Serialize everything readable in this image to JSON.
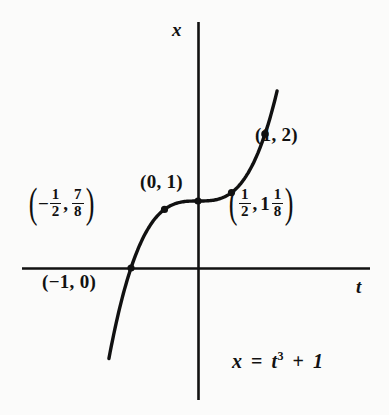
{
  "figure": {
    "caption_equation": "x = t³ + 1",
    "background_color": "#fbfbfa",
    "ink_color": "#111111"
  },
  "axes": {
    "x_axis_label": "x",
    "t_axis_label": "t",
    "origin_px": [
      198,
      268
    ],
    "pixels_per_unit": 67,
    "horizontal_extent_px": [
      22,
      370
    ],
    "vertical_extent_px": [
      22,
      400
    ]
  },
  "equation": {
    "lhs": "x",
    "equals": "=",
    "variable": "t",
    "exponent": "3",
    "plus": "+",
    "constant": "1"
  },
  "labels": {
    "point_1_2": "(1, 2)",
    "point_0_1": "(0, 1)",
    "point_m1_0": "(−1, 0)",
    "point_mhalf": {
      "open": "(",
      "sign": "−",
      "x_num": "1",
      "x_den": "2",
      "comma": ",",
      "y_num": "7",
      "y_den": "8",
      "close": ")"
    },
    "point_half": {
      "open": "(",
      "x_num": "1",
      "x_den": "2",
      "comma": ",",
      "y_whole": "1",
      "y_num": "1",
      "y_den": "8",
      "close": ")"
    }
  },
  "chart_data": {
    "type": "line",
    "title": "",
    "xlabel": "t",
    "ylabel": "x",
    "function": "x = t^3 + 1",
    "xlim": [
      -2.63,
      2.57
    ],
    "ylim": [
      -1.97,
      3.67
    ],
    "grid": false,
    "legend": false,
    "axis_style": "cartesian-crosshair",
    "curve": {
      "name": "x = t^3 + 1",
      "t_start": -1.33,
      "t_end": 1.18,
      "color": "#111111",
      "line_width_px": 3.4
    },
    "marked_points": [
      {
        "label": "(1, 2)",
        "t": 1,
        "x": 2,
        "label_position": "right"
      },
      {
        "label": "(0, 1)",
        "t": 0,
        "x": 1,
        "label_position": "upper-left"
      },
      {
        "label": "(−1, 0)",
        "t": -1,
        "x": 0,
        "label_position": "below-left"
      },
      {
        "label": "(−1/2, 7/8)",
        "t": -0.5,
        "x": 0.875,
        "label_position": "left"
      },
      {
        "label": "(1/2, 1 1/8)",
        "t": 0.5,
        "x": 1.125,
        "label_position": "right"
      }
    ]
  }
}
